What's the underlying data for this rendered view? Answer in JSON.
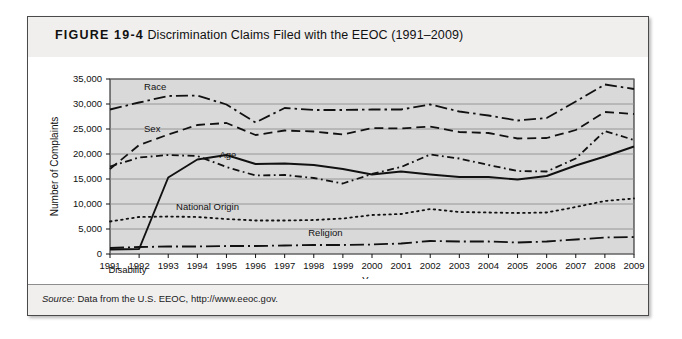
{
  "figure": {
    "number": "FIGURE 19-4",
    "caption": "Discrimination Claims Filed with the EEOC (1991–2009)",
    "source_label": "Source:",
    "source_text": " Data from the U.S. EEOC, http://www.eeoc.gov."
  },
  "chart_data": {
    "type": "line",
    "title": "Discrimination Claims Filed with the EEOC (1991–2009)",
    "xlabel": "Year",
    "ylabel": "Number of Complaints",
    "x": [
      1991,
      1992,
      1993,
      1994,
      1995,
      1996,
      1997,
      1998,
      1999,
      2000,
      2001,
      2002,
      2003,
      2004,
      2005,
      2006,
      2007,
      2008,
      2009
    ],
    "categories": [
      "1991",
      "1992",
      "1993",
      "1994",
      "1995",
      "1996",
      "1997",
      "1998",
      "1999",
      "2000",
      "2001",
      "2002",
      "2003",
      "2004",
      "2005",
      "2006",
      "2007",
      "2008",
      "2009"
    ],
    "ylim": [
      0,
      35000
    ],
    "xlim": [
      1991,
      2009
    ],
    "yticks": [
      0,
      5000,
      10000,
      15000,
      20000,
      25000,
      30000,
      35000
    ],
    "ytick_labels": [
      "0",
      "5,000",
      "10,000",
      "15,000",
      "20,000",
      "25,000",
      "30,000",
      "35,000"
    ],
    "grid": true,
    "grid_axis": "y",
    "legend": "inline-labels",
    "plot_background": "#d9d9d9",
    "series": [
      {
        "name": "Race",
        "label": "Race",
        "style": "dash-dot",
        "color": "#111111",
        "values": [
          28900,
          30300,
          31600,
          31700,
          29900,
          26300,
          29200,
          28800,
          28800,
          28900,
          28900,
          29900,
          28500,
          27700,
          26700,
          27200,
          30500,
          33900,
          33000
        ]
      },
      {
        "name": "Sex",
        "label": "Sex",
        "style": "dashed",
        "color": "#111111",
        "values": [
          17000,
          21800,
          23900,
          25800,
          26200,
          23800,
          24700,
          24500,
          23900,
          25200,
          25100,
          25500,
          24400,
          24200,
          23100,
          23200,
          24800,
          28400,
          28000
        ]
      },
      {
        "name": "Age",
        "label": "Age",
        "style": "dash-dot-fine",
        "color": "#111111",
        "values": [
          17500,
          19300,
          19800,
          19600,
          17400,
          15700,
          15800,
          15200,
          14100,
          16000,
          17400,
          19900,
          19100,
          17800,
          16600,
          16500,
          19100,
          24600,
          22800
        ]
      },
      {
        "name": "Disability",
        "label": "Disability",
        "style": "solid",
        "color": "#111111",
        "values": [
          900,
          1000,
          15300,
          18900,
          19800,
          18000,
          18100,
          17800,
          17000,
          15900,
          16500,
          15900,
          15400,
          15400,
          14900,
          15600,
          17700,
          19500,
          21500
        ]
      },
      {
        "name": "National Origin",
        "label": "National Origin",
        "style": "dotted",
        "color": "#111111",
        "values": [
          6500,
          7400,
          7500,
          7400,
          7000,
          6700,
          6700,
          6800,
          7100,
          7800,
          8000,
          9000,
          8400,
          8300,
          8200,
          8300,
          9400,
          10600,
          11100
        ]
      },
      {
        "name": "Religion",
        "label": "Religion",
        "style": "long-dash-dot",
        "color": "#111111",
        "values": [
          1200,
          1400,
          1500,
          1500,
          1600,
          1600,
          1700,
          1800,
          1800,
          1900,
          2100,
          2600,
          2500,
          2500,
          2300,
          2500,
          2900,
          3300,
          3400
        ]
      }
    ]
  }
}
